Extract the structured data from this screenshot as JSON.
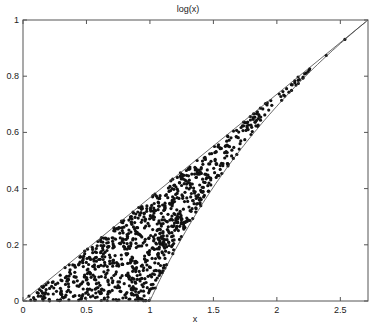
{
  "chart_data": {
    "type": "scatter",
    "title": "log(x)",
    "xlabel": "x",
    "ylabel": "",
    "xlim": [
      0,
      2.718
    ],
    "ylim": [
      0,
      1
    ],
    "xticks": [
      0,
      0.5,
      1,
      1.5,
      2,
      2.5
    ],
    "xtick_labels": [
      "0",
      "0.5",
      "1",
      "1.5",
      "2",
      "2.5"
    ],
    "yticks": [
      0,
      0.2,
      0.4,
      0.6,
      0.8,
      1
    ],
    "ytick_labels": [
      "0",
      "0.2",
      "0.4",
      "0.6",
      "0.8",
      "1"
    ],
    "grid": false,
    "legend": null,
    "series": [
      {
        "name": "upper boundary line y = x/e",
        "kind": "line",
        "points": [
          [
            0,
            0
          ],
          [
            2.718,
            1
          ]
        ]
      },
      {
        "name": "lower boundary curve y = log(x)",
        "kind": "line",
        "x": [
          0,
          1,
          1.2,
          1.4,
          1.6,
          1.8,
          2.0,
          2.2,
          2.4,
          2.6,
          2.718
        ],
        "y": [
          0,
          0,
          0.182,
          0.336,
          0.47,
          0.588,
          0.693,
          0.788,
          0.875,
          0.956,
          1
        ]
      },
      {
        "name": "random samples under/between curves",
        "kind": "scatter",
        "count": 1000,
        "region": "points (x,y) with 0<=x<=e, max(0,log x) <= y <= x/e",
        "marker": "filled circle",
        "color": "#111111"
      }
    ]
  },
  "colors": {
    "axis": "#555555",
    "line": "#444444",
    "points": "#111111"
  }
}
